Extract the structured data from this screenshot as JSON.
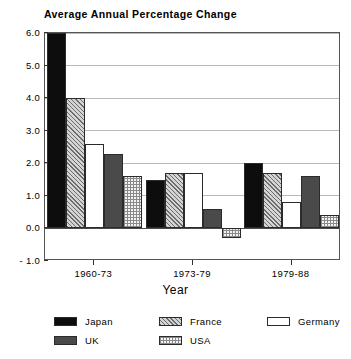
{
  "chart_data": {
    "type": "bar",
    "title": "Average Annual Percentage Change",
    "xlabel": "Year",
    "ylabel": "",
    "categories": [
      "1960-73",
      "1973-79",
      "1979-88"
    ],
    "ylim": [
      -1.0,
      6.0
    ],
    "yticks": [
      "6.0",
      "5.0",
      "4.0",
      "3.0",
      "2.0",
      "1.0",
      "0.0",
      "- 1.0"
    ],
    "ytick_values": [
      6.0,
      5.0,
      4.0,
      3.0,
      2.0,
      1.0,
      0.0,
      -1.0
    ],
    "grid": true,
    "legend_position": "bottom",
    "series": [
      {
        "name": "Japan",
        "values": [
          6.0,
          1.5,
          2.0
        ],
        "pattern": "solid-black",
        "color": "#0d0d0d"
      },
      {
        "name": "France",
        "values": [
          4.0,
          1.7,
          1.7
        ],
        "pattern": "diagonal-hatch",
        "color": "#d4d4d4"
      },
      {
        "name": "Germany",
        "values": [
          2.6,
          1.7,
          0.8
        ],
        "pattern": "solid-white",
        "color": "#ffffff"
      },
      {
        "name": "UK",
        "values": [
          2.3,
          0.6,
          1.6
        ],
        "pattern": "solid-gray",
        "color": "#4a4a4a"
      },
      {
        "name": "USA",
        "values": [
          1.6,
          -0.3,
          0.4
        ],
        "pattern": "grid-crosshatch",
        "color": "#f2f2f2"
      }
    ]
  },
  "legend": {
    "items": [
      {
        "label": "Japan"
      },
      {
        "label": "France"
      },
      {
        "label": "Germany"
      },
      {
        "label": "UK"
      },
      {
        "label": "USA"
      }
    ]
  }
}
